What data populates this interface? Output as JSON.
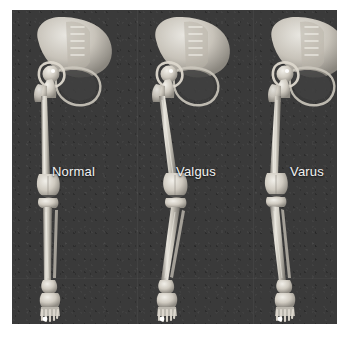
{
  "figure": {
    "panel_background": "#3a3a3a",
    "page_background": "#ffffff",
    "bone_color": "#d8d4cb",
    "label_color": "#f2f2f2",
    "marker_color": "#ffffff"
  },
  "panels": [
    {
      "id": "normal",
      "label": "Normal",
      "label_x": 52,
      "label_y": 164,
      "alignment": "neutral",
      "description": "Neutral mechanical axis; femur and tibia aligned in a straight weight-bearing line through the knee center",
      "knee_angle_deg": 0
    },
    {
      "id": "valgus",
      "label": "Valgus",
      "label_x": 176,
      "label_y": 164,
      "alignment": "knock-knee",
      "description": "Valgus deformity; knee deviates medially and the distal tibia angles laterally",
      "knee_angle_deg": 10
    },
    {
      "id": "varus",
      "label": "Varus",
      "label_x": 290,
      "label_y": 164,
      "alignment": "bow-leg",
      "description": "Varus deformity; knee deviates laterally giving a bow-legged weight-bearing axis",
      "knee_angle_deg": -8
    }
  ],
  "anatomy": {
    "parts": [
      "sacrum",
      "ilium",
      "acetabulum",
      "femoral-head",
      "femoral-neck",
      "greater-trochanter",
      "femoral-shaft",
      "femoral-condyles",
      "tibial-plateau",
      "tibial-shaft",
      "fibula",
      "medial-malleolus",
      "talus",
      "calcaneus",
      "metatarsals",
      "phalanges"
    ]
  }
}
